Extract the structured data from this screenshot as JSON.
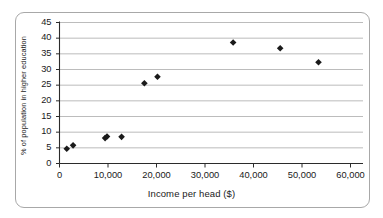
{
  "chart_data": {
    "type": "scatter",
    "title": "",
    "xlabel": "Income per head ($)",
    "ylabel": "% of population in higher education",
    "xlim": [
      0,
      60000
    ],
    "ylim": [
      0,
      45
    ],
    "xticks": [
      0,
      10000,
      20000,
      30000,
      40000,
      50000,
      60000
    ],
    "xtick_labels": [
      "0",
      "10,000",
      "20,000",
      "30,000",
      "40,000",
      "50,000",
      "60,000"
    ],
    "yticks": [
      0,
      5,
      10,
      15,
      20,
      25,
      30,
      35,
      40,
      45
    ],
    "ytick_labels": [
      "0",
      "5",
      "10",
      "15",
      "20",
      "25",
      "30",
      "35",
      "40",
      "45"
    ],
    "grid": "horizontal",
    "legend": "none",
    "marker": "diamond",
    "marker_color": "#1a1a1a",
    "points": [
      {
        "x": 1500,
        "y": 4.7
      },
      {
        "x": 2800,
        "y": 5.8
      },
      {
        "x": 9400,
        "y": 8.1
      },
      {
        "x": 9800,
        "y": 8.6
      },
      {
        "x": 12800,
        "y": 8.5
      },
      {
        "x": 17500,
        "y": 25.6
      },
      {
        "x": 20200,
        "y": 27.7
      },
      {
        "x": 35800,
        "y": 38.6
      },
      {
        "x": 45500,
        "y": 36.8
      },
      {
        "x": 53400,
        "y": 32.3
      }
    ]
  },
  "style": {
    "axis_color": "#2b2b2b",
    "grid_color": "#b4b4b4",
    "frame_color": "#a8a8a8",
    "background": "#ffffff"
  }
}
